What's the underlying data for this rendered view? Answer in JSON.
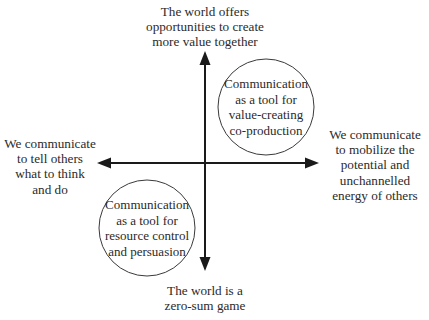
{
  "diagram": {
    "type": "quadrant-axes",
    "axes": {
      "top": "The world offers\nopportunities to create\nmore value together",
      "bottom": "The world is a\nzero-sum game",
      "left": "We communicate\nto tell others\nwhat to think\nand do",
      "right": "We communicate\nto mobilize the\npotential and\nunchannelled\nenergy of others"
    },
    "circles": {
      "top_right": "Communication\nas a tool for\nvalue-creating\nco-production",
      "bottom_left": "Communication\nas a tool for\nresource control\nand persuasion"
    },
    "colors": {
      "line": "#1a1a1a",
      "text": "#2a2a2a",
      "background": "#ffffff"
    }
  }
}
